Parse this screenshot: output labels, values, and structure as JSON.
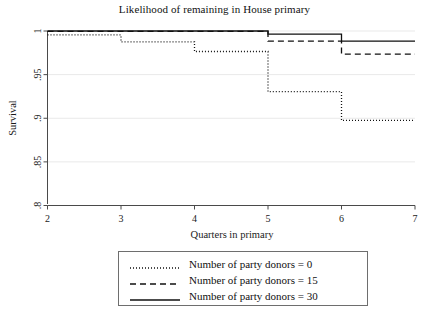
{
  "chart_data": {
    "type": "line",
    "title": "Likelihood of remaining in House primary",
    "xlabel": "Quarters in primary",
    "ylabel": "Survival",
    "xlim": [
      2,
      7
    ],
    "ylim": [
      0.8,
      1.0
    ],
    "xticks": [
      "2",
      "3",
      "4",
      "5",
      "6",
      "7"
    ],
    "yticks": [
      ".8",
      ".85",
      ".9",
      ".95",
      "1"
    ],
    "grid": true,
    "grid_axis": "y",
    "legend_position": "below-plot",
    "step_shape": "post",
    "x": [
      2,
      3,
      4,
      5,
      6,
      7
    ],
    "series": [
      {
        "name": "Number of party donors = 0",
        "style": "dotted",
        "values": [
          0.9955,
          0.9875,
          0.9765,
          0.9305,
          0.8975,
          0.8975
        ]
      },
      {
        "name": "Number of party donors = 15",
        "style": "dashed",
        "values": [
          0.9995,
          0.9995,
          0.9995,
          0.9885,
          0.9735,
          0.9735
        ]
      },
      {
        "name": "Number of party donors = 30",
        "style": "solid",
        "values": [
          1.0,
          1.0,
          1.0,
          0.9965,
          0.9885,
          0.9885
        ]
      }
    ]
  },
  "legend": {
    "items": [
      {
        "label": "Number of party donors = 0",
        "style": "dotted"
      },
      {
        "label": "Number of party donors = 15",
        "style": "dashed"
      },
      {
        "label": "Number of party donors = 30",
        "style": "solid"
      }
    ]
  },
  "colors": {
    "line": "#111111",
    "axis": "#4a4a4a",
    "grid": "#e9e9e9",
    "background": "#ffffff"
  }
}
